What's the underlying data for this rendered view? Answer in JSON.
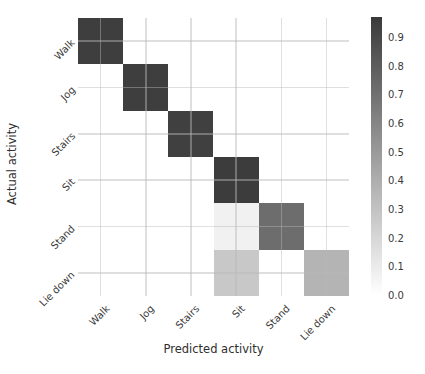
{
  "figure": {
    "background": "#ffffff",
    "text_color": "#3a3a3a",
    "grid_color": "rgba(185,185,185,0.45)"
  },
  "chart_data": {
    "type": "heatmap",
    "title": "",
    "xlabel": "Predicted activity",
    "ylabel": "Actual activity",
    "categories": [
      "Walk",
      "Jog",
      "Stairs",
      "Sit",
      "Stand",
      "Lie down"
    ],
    "rows_axis": "Actual activity",
    "cols_axis": "Predicted activity",
    "matrix": [
      [
        0.95,
        0.0,
        0.0,
        0.0,
        0.0,
        0.0
      ],
      [
        0.0,
        0.95,
        0.0,
        0.0,
        0.0,
        0.0
      ],
      [
        0.0,
        0.0,
        0.94,
        0.0,
        0.0,
        0.0
      ],
      [
        0.0,
        0.0,
        0.0,
        0.96,
        0.0,
        0.0
      ],
      [
        0.0,
        0.0,
        0.0,
        0.07,
        0.72,
        0.0
      ],
      [
        0.0,
        0.0,
        0.0,
        0.27,
        0.0,
        0.37
      ]
    ],
    "vmin": 0.0,
    "vmax": 0.97,
    "colormap": "gray_r",
    "grid": true,
    "legend_position": "none",
    "colorbar_position": "right",
    "colorbar_ticks": [
      0.9,
      0.8,
      0.7,
      0.6,
      0.5,
      0.4,
      0.3,
      0.2,
      0.1,
      0.0
    ]
  }
}
